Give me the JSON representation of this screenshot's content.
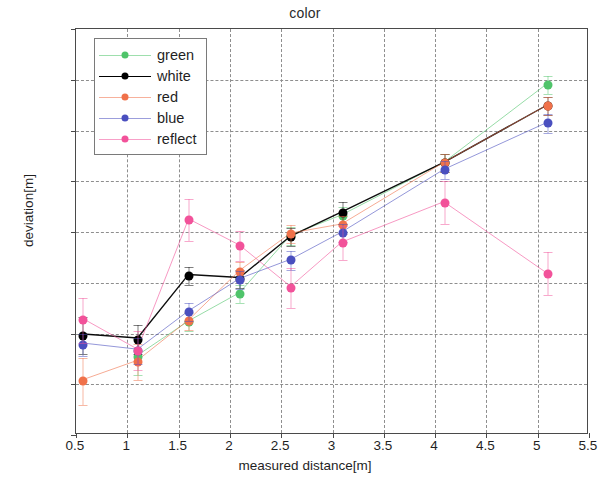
{
  "chart_data": {
    "type": "line",
    "title": "color",
    "xlabel": "measured distance[m]",
    "ylabel": "deviation[m]",
    "xlim": [
      0.5,
      5.5
    ],
    "ylim": [
      -0.01,
      0.03
    ],
    "xticks": [
      "0.5",
      "1",
      "1.5",
      "2",
      "2.5",
      "3",
      "3.5",
      "4",
      "4.5",
      "5",
      "5.5"
    ],
    "xtick_values": [
      0.5,
      1,
      1.5,
      2,
      2.5,
      3,
      3.5,
      4,
      4.5,
      5,
      5.5
    ],
    "yticks": [
      "-0.01",
      "-0.005",
      "0",
      "0.005",
      "0.01",
      "0.015",
      "0.02",
      "0.025",
      "0.03"
    ],
    "ytick_values": [
      -0.01,
      -0.005,
      0,
      0.005,
      0.01,
      0.015,
      0.02,
      0.025,
      0.03
    ],
    "grid": true,
    "legend_position": "top-left",
    "x": [
      0.57,
      1.1,
      1.6,
      2.1,
      2.6,
      3.1,
      4.1,
      5.1
    ],
    "series": [
      {
        "name": "green",
        "color": "#4fc46a",
        "x": [
          1.1,
          1.6,
          2.1,
          2.6,
          3.1,
          4.1,
          5.1
        ],
        "values": [
          -0.0023,
          0.0011,
          0.0039,
          0.0096,
          0.0116,
          0.0168,
          0.0245
        ],
        "errors": [
          0.0018,
          0.0009,
          0.0009,
          0.0009,
          0.0009,
          0.0009,
          0.0009
        ]
      },
      {
        "name": "white",
        "color": "#000000",
        "x": [
          0.57,
          1.1,
          1.6,
          2.1,
          2.6,
          3.1,
          4.1,
          5.1
        ],
        "values": [
          -0.0002,
          -0.0006,
          0.0057,
          0.0054,
          0.0095,
          0.0119,
          0.0168,
          0.0224
        ],
        "errors": [
          0.0018,
          0.0014,
          0.0009,
          0.0009,
          0.0009,
          0.0011,
          0.0009,
          0.0009
        ]
      },
      {
        "name": "red",
        "color": "#f0714a",
        "x": [
          0.57,
          1.1,
          1.6,
          2.1,
          2.6,
          3.1,
          4.1,
          5.1
        ],
        "values": [
          -0.0047,
          -0.0028,
          0.0012,
          0.0061,
          0.0098,
          0.0107,
          0.0168,
          0.0224
        ],
        "errors": [
          0.0023,
          0.0018,
          0.0009,
          0.0009,
          0.0009,
          0.0009,
          0.0009,
          0.0009
        ]
      },
      {
        "name": "blue",
        "color": "#4a4fbf",
        "x": [
          0.57,
          1.1,
          1.6,
          2.1,
          2.6,
          3.1,
          4.1,
          5.1
        ],
        "values": [
          -0.0011,
          -0.0017,
          0.0021,
          0.0053,
          0.0072,
          0.0099,
          0.0161,
          0.0207
        ],
        "errors": [
          0.0011,
          0.0013,
          0.0009,
          0.0009,
          0.0009,
          0.0009,
          0.0009,
          0.0009
        ]
      },
      {
        "name": "reflect",
        "color": "#f2529a",
        "x": [
          0.57,
          1.1,
          1.6,
          2.1,
          2.6,
          3.1,
          4.1,
          5.1
        ],
        "values": [
          0.0013,
          -0.0017,
          0.0112,
          0.0086,
          0.0045,
          0.0089,
          0.0129,
          0.0059
        ],
        "errors": [
          0.0022,
          0.0019,
          0.0021,
          0.0015,
          0.002,
          0.0017,
          0.0021,
          0.0021
        ]
      }
    ],
    "legend_entries": [
      {
        "label": "green",
        "color": "#4fc46a"
      },
      {
        "label": "white",
        "color": "#000000"
      },
      {
        "label": "red",
        "color": "#f0714a"
      },
      {
        "label": "blue",
        "color": "#4a4fbf"
      },
      {
        "label": "reflect",
        "color": "#f2529a"
      }
    ]
  }
}
